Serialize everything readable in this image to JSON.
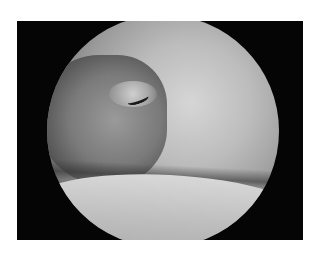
{
  "image": {
    "description": "Arthroscopic view of joint interior within circular scope field on black background",
    "colors": {
      "background": "#ffffff",
      "frame": "#050505",
      "scope_light": "#d6d6d6",
      "scope_dark": "#3a3a3a"
    }
  },
  "caption": {
    "text": ""
  }
}
